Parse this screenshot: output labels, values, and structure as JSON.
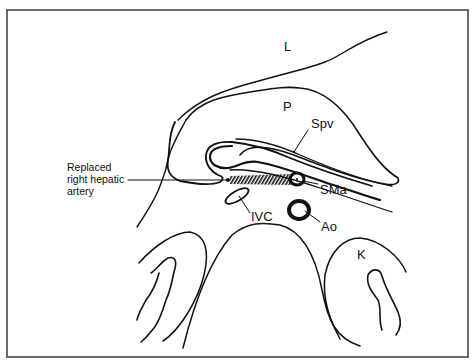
{
  "figure": {
    "type": "anatomical cross-section line drawing",
    "colors": {
      "ink": "#111111",
      "frame": "#6a6a6a",
      "background": "#ffffff"
    }
  },
  "labels": {
    "liver": "L",
    "pancreas": "P",
    "splenic_portal_vein": "Spv",
    "superior_mesenteric_artery": "SMa",
    "inferior_vena_cava": "IVC",
    "aorta": "Ao",
    "kidney": "K",
    "replaced_artery_line1": "Replaced",
    "replaced_artery_line2": "right hepatic",
    "replaced_artery_line3": "artery"
  }
}
